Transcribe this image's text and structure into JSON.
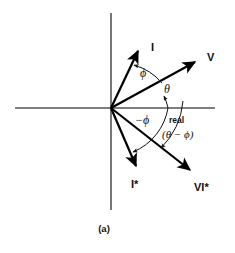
{
  "figure": {
    "caption": "(a)",
    "type": "phasor-diagram",
    "background_color": "#ffffff",
    "line_color": "#000000",
    "axis_color": "#555555"
  },
  "axes": {
    "origin": {
      "x": 111,
      "y": 108
    },
    "horizontal": {
      "x1": 15,
      "y1": 108,
      "x2": 215,
      "y2": 108,
      "label": "real"
    },
    "vertical": {
      "x1": 111,
      "y1": 13,
      "x2": 111,
      "y2": 210,
      "label": ""
    }
  },
  "vectors": [
    {
      "name": "current-phasor",
      "label": "I",
      "angle_deg": 60,
      "tip": {
        "x": 140,
        "y": 48
      },
      "label_pos": {
        "x": 151,
        "y": 50
      }
    },
    {
      "name": "voltage-phasor",
      "label": "V",
      "angle_deg": 28,
      "tip": {
        "x": 198,
        "y": 60
      },
      "label_pos": {
        "x": 208,
        "y": 60
      }
    },
    {
      "name": "conjugate-current-phasor",
      "label": "I*",
      "angle_deg": -60,
      "tip": {
        "x": 138,
        "y": 170
      },
      "label_pos": {
        "x": 134,
        "y": 186
      }
    },
    {
      "name": "complex-power-phasor",
      "label": "VI*",
      "angle_deg": -32,
      "tip": {
        "x": 193,
        "y": 173
      },
      "label_pos": {
        "x": 196,
        "y": 190
      }
    }
  ],
  "angle_labels": [
    {
      "name": "phi-upper",
      "text": "ϕ",
      "x": 142,
      "y": 74
    },
    {
      "name": "theta",
      "text": "θ",
      "x": 166,
      "y": 90
    },
    {
      "name": "negative-phi",
      "text": "−ϕ",
      "x": 140,
      "y": 121
    },
    {
      "name": "real-axis-label",
      "text": "real",
      "x": 175,
      "y": 121
    },
    {
      "name": "theta-minus-phi",
      "text": "(θ − ϕ)",
      "x": 168,
      "y": 136
    }
  ]
}
